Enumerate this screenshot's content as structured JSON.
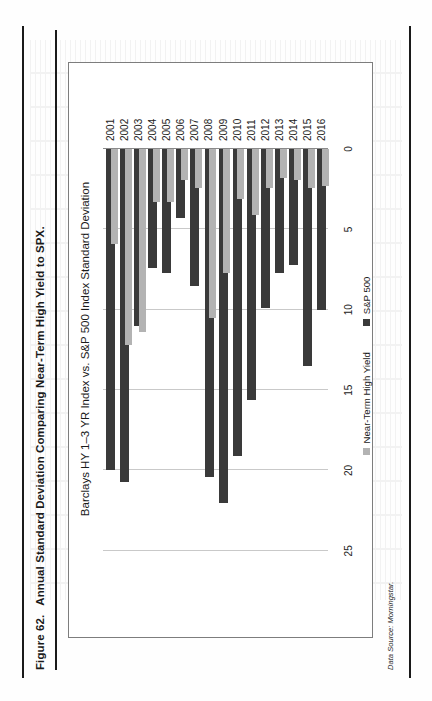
{
  "figure": {
    "number": "Figure 62.",
    "title": "Annual Standard Deviation Comparing Near-Term High Yield to SPX.",
    "source_note": "Data Source: Morningstar."
  },
  "legend": {
    "position": "bottom-center",
    "items": [
      {
        "label": "Near-Term High Yield",
        "color": "#b3b3b3"
      },
      {
        "label": "S&P 500",
        "color": "#3a3a3a"
      }
    ]
  },
  "axis": {
    "ticks": [
      "25",
      "20",
      "15",
      "10",
      "5",
      "0"
    ],
    "tick_values": [
      25,
      20,
      15,
      10,
      5,
      0
    ],
    "min": 0,
    "max": 27,
    "reversed": true,
    "grid": true
  },
  "chart_data": {
    "type": "bar",
    "orientation": "horizontal",
    "title": "Barclays HY 1–3 YR Index vs. S&P 500 Index Standard Deviation",
    "xlabel": "",
    "ylabel": "",
    "xlim": [
      0,
      27
    ],
    "grid": true,
    "legend_position": "bottom-center",
    "categories": [
      "2001",
      "2002",
      "2003",
      "2004",
      "2005",
      "2006",
      "2007",
      "2008",
      "2009",
      "2010",
      "2011",
      "2012",
      "2013",
      "2014",
      "2015",
      "2016"
    ],
    "series": [
      {
        "name": "Near-Term High Yield",
        "color": "#b3b3b3",
        "values": [
          5.9,
          12.2,
          11.4,
          3.3,
          3.3,
          1.9,
          2.4,
          10.5,
          7.7,
          3.1,
          4.1,
          2.4,
          1.8,
          1.9,
          2.4,
          2.3
        ]
      },
      {
        "name": "S&P 500",
        "color": "#3a3a3a",
        "values": [
          20.0,
          20.7,
          11.0,
          7.4,
          7.7,
          4.3,
          8.5,
          20.4,
          22.0,
          19.1,
          15.6,
          9.9,
          7.7,
          7.2,
          13.5,
          10.0
        ]
      }
    ]
  }
}
